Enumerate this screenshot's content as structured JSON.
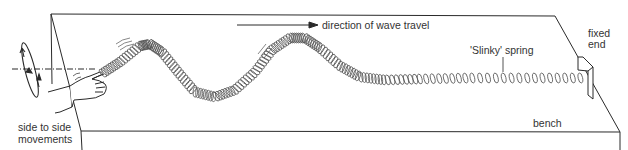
{
  "diagram": {
    "type": "physics-apparatus",
    "labels": {
      "direction": "direction of wave travel",
      "spring": "'Slinky' spring",
      "fixed_end_line1": "fixed",
      "fixed_end_line2": "end",
      "bench": "bench",
      "movement_line1": "side to side",
      "movement_line2": "movements"
    },
    "colors": {
      "line": "#2a2a2a",
      "spring": "#555555",
      "background": "#ffffff"
    }
  }
}
